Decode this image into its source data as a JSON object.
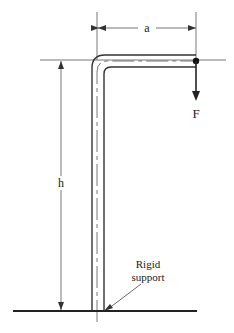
{
  "diagram": {
    "labels": {
      "a": "a",
      "h": "h",
      "force": "F",
      "support_line1": "Rigid",
      "support_line2": "support"
    },
    "colors": {
      "line": "#333333",
      "thin": "#555555",
      "background": "#ffffff"
    }
  }
}
